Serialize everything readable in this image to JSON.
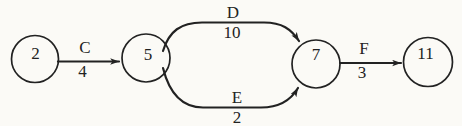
{
  "diagram": {
    "kind": "activity-on-arrow-network",
    "colors": {
      "ink": "#222222",
      "paper": "#fbfaf6"
    },
    "nodes": [
      {
        "id": "2"
      },
      {
        "id": "5"
      },
      {
        "id": "7"
      },
      {
        "id": "11"
      }
    ],
    "edges": [
      {
        "name": "C",
        "duration": "4",
        "from": "2",
        "to": "5"
      },
      {
        "name": "D",
        "duration": "10",
        "from": "5",
        "to": "7"
      },
      {
        "name": "E",
        "duration": "2",
        "from": "5",
        "to": "7"
      },
      {
        "name": "F",
        "duration": "3",
        "from": "7",
        "to": "11"
      }
    ]
  }
}
